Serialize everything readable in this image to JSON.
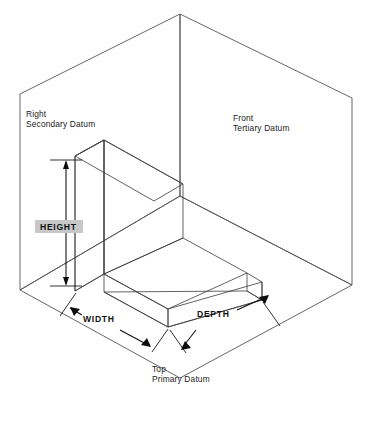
{
  "figure": {
    "background_color": "#ffffff"
  },
  "datum_planes": [
    {
      "id": "secondary",
      "line1": "Right",
      "line2": "Secondary Datum",
      "fill_color": "#c8c8c8",
      "label_x": 26,
      "label_y": 117
    },
    {
      "id": "tertiary",
      "line1": "Front",
      "line2": "Tertiary Datum",
      "fill_color": "#f2f2f2",
      "label_x": 233,
      "label_y": 121
    },
    {
      "id": "primary",
      "line1": "Top",
      "line2": "Primary Datum",
      "fill_color": "#dedede",
      "label_x": 152,
      "label_y": 372
    }
  ],
  "dimensions": [
    {
      "id": "height",
      "label": "HEIGHT",
      "label_x": 40,
      "label_y": 228,
      "orientation": "vertical"
    },
    {
      "id": "width",
      "label": "WIDTH",
      "label_x": 83,
      "label_y": 318,
      "orientation": "isometric-left"
    },
    {
      "id": "depth",
      "label": "DEPTH",
      "label_x": 197,
      "label_y": 313,
      "orientation": "isometric-right"
    }
  ],
  "part": {
    "name": "L-bracket",
    "faces": {
      "wall_front": "#545454",
      "wall_side": "#8c8c8c",
      "wall_top": "#b4b4b4",
      "base_top": "#9a9a9a",
      "base_front": "#6f6f6f",
      "base_side": "#848484"
    }
  },
  "colors": {
    "outline": "#55555a",
    "part_edge": "#3a3a3a",
    "dimension": "#0d0d0d",
    "text": "#1b1b1b"
  }
}
